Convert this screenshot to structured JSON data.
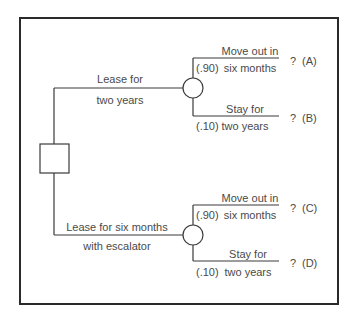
{
  "diagram": {
    "type": "decision-tree",
    "decision_node": {
      "shape": "square"
    },
    "decisions": [
      {
        "label_line1": "Lease for",
        "label_line2": "two years",
        "chance_node": {
          "shape": "circle"
        },
        "outcomes": [
          {
            "prob": "(.90)",
            "label_line1": "Move out in",
            "label_line2": "six months",
            "payoff": "?",
            "id": "(A)"
          },
          {
            "prob": "(.10)",
            "label_line1": "Stay for",
            "label_line2": "two years",
            "payoff": "?",
            "id": "(B)"
          }
        ]
      },
      {
        "label_line1": "Lease for six months",
        "label_line2": "with escalator",
        "chance_node": {
          "shape": "circle"
        },
        "outcomes": [
          {
            "prob": "(.90)",
            "label_line1": "Move out in",
            "label_line2": "six months",
            "payoff": "?",
            "id": "(C)"
          },
          {
            "prob": "(.10)",
            "label_line1": "Stay for",
            "label_line2": "two years",
            "payoff": "?",
            "id": "(D)"
          }
        ]
      }
    ],
    "colors": {
      "line": "#3a3a3a",
      "text": "#4a4a4a",
      "frame": "#2a2a2a"
    }
  }
}
